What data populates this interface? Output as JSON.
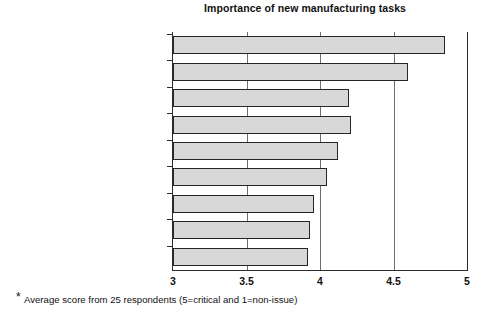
{
  "chart_data": {
    "type": "bar",
    "orientation": "horizontal",
    "title": "Importance of new manufacturing tasks",
    "xlabel": "",
    "ylabel": "",
    "xlim": [
      3,
      5
    ],
    "ylim": null,
    "grid": true,
    "grid_axis": "x",
    "legend": null,
    "legend_position": "none",
    "xticks": [
      "3",
      "3.5",
      "4",
      "4.5",
      "5"
    ],
    "xtick_values": [
      3,
      3.5,
      4,
      4.5,
      5
    ],
    "categories": [
      "Customer focus",
      "Extremely flexible and quick",
      "Product development role",
      "Broader responsibilities",
      "Member of business team",
      "Have to do all well",
      "Global scope",
      "Reach out",
      "Change manufacturing culture"
    ],
    "values": [
      4.85,
      4.6,
      4.2,
      4.21,
      4.12,
      4.05,
      3.96,
      3.93,
      3.92
    ],
    "bar_fill": "#d8d8d8",
    "bar_edge": "#262626",
    "annotation": "* Average score from 25 respondents (5=critical and 1=non-issue)"
  },
  "footnote": {
    "marker": "*",
    "text": "Average score from 25 respondents (5=critical and 1=non-issue)"
  }
}
